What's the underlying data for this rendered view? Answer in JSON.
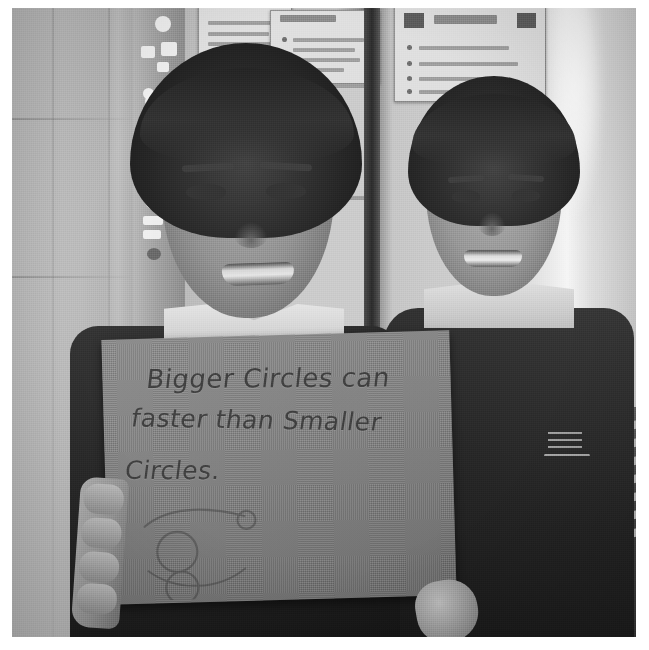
{
  "image": {
    "kind": "scanned-photograph",
    "orientation": "square",
    "color_mode": "grayscale",
    "border_color": "#ffffff",
    "photo_background_color": "#b9b9b9"
  },
  "sign": {
    "name": "handwritten-card",
    "material": "grey card / sugar paper",
    "color": "#86837e",
    "ink_color": "#403c38",
    "lines": [
      "Bigger Circles can",
      "faster than Smaller",
      "Circles."
    ],
    "drawing_description": "small pencil sketch of two circles on a sloping line"
  },
  "subjects": [
    {
      "name": "child-left",
      "position": "foreground-left",
      "expression": "smiling",
      "hair": "dark fringe",
      "uniform": "dark polo shirt with light collar",
      "action": "holding the card with both hands"
    },
    {
      "name": "child-right",
      "position": "background-right",
      "expression": "smiling",
      "hair": "dark short",
      "uniform": "dark school polo with light collar and embroidered crest"
    }
  ],
  "background": {
    "setting": "classroom wall",
    "elements": [
      {
        "name": "poster-upper-left",
        "content": "illegible printed notice"
      },
      {
        "name": "poster-upper-centre",
        "content": "illegible titled notice with bullet list"
      },
      {
        "name": "poster-upper-right",
        "content": "illegible notice with logos and bullet list"
      },
      {
        "name": "decorated-strip",
        "content": "vertical column of small icons and stickers"
      },
      {
        "name": "door-jamb",
        "content": "dark vertical edge"
      },
      {
        "name": "book-stack",
        "content": "stacked books and papers on the right"
      },
      {
        "name": "window-glare",
        "content": "bright highlight on the right wall"
      }
    ]
  },
  "crest": {
    "name": "school-crest",
    "shape": "triangular emblem with horizontal bars"
  }
}
